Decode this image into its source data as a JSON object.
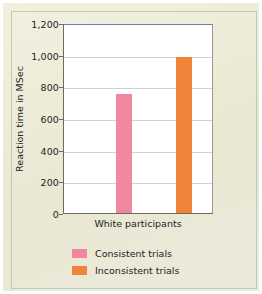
{
  "chart_data": {
    "type": "bar",
    "title": "",
    "subtitle": "",
    "xlabel": "",
    "ylabel": "Reaction time in MSec",
    "categories": [
      "White participants"
    ],
    "series": [
      {
        "name": "Consistent trials",
        "values": [
          750
        ],
        "color": "#f2869f"
      },
      {
        "name": "Inconsistent trials",
        "values": [
          985
        ],
        "color": "#f08438"
      }
    ],
    "ylim": [
      0,
      1200
    ],
    "ytick_values": [
      0,
      200,
      400,
      600,
      800,
      1000,
      1200
    ],
    "ytick_labels": [
      "0",
      "200",
      "400",
      "600",
      "800",
      "1,000",
      "1,200"
    ],
    "grid": true,
    "grid_axis": "y",
    "legend_position": "bottom-left"
  },
  "axes": {
    "y_title": "Reaction time in MSec",
    "y_ticks": [
      {
        "label": "1,200",
        "value": 1200
      },
      {
        "label": "1,000",
        "value": 1000
      },
      {
        "label": "800",
        "value": 800
      },
      {
        "label": "600",
        "value": 600
      },
      {
        "label": "400",
        "value": 400
      },
      {
        "label": "200",
        "value": 200
      },
      {
        "label": "0",
        "value": 0
      }
    ],
    "x_categories": [
      {
        "label": "White participants"
      }
    ]
  },
  "legend": {
    "items": [
      {
        "label": "Consistent trials",
        "color": "#f2869f"
      },
      {
        "label": "Inconsistent trials",
        "color": "#f08438"
      }
    ]
  },
  "colors": {
    "page_background": "#edecd8",
    "plot_background": "#ffffff",
    "gridline": "#cfcfd6",
    "axis": "#6b6b5e",
    "text": "#23231f",
    "consistent": "#f2869f",
    "inconsistent": "#f08438"
  }
}
